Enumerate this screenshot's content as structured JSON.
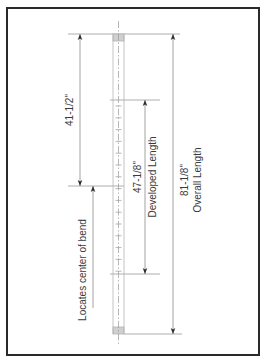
{
  "drawing": {
    "frame": {
      "x": 7,
      "y": 8,
      "w": 252,
      "h": 347,
      "stroke": "#2a2a2a"
    },
    "colors": {
      "line": "#9a9a9a",
      "dim": "#8c8c8c",
      "text": "#3a3a3a",
      "cap": "#cfcfcf",
      "pipe": "#b5b5b5"
    },
    "pipe": {
      "x1": 113,
      "x2": 124,
      "top": 34,
      "bottom": 334,
      "cap_len": 7,
      "center_top": 21,
      "center_bottom": 346
    },
    "ticks": {
      "from": 106,
      "to": 272,
      "step": 11.8
    },
    "dimensions": {
      "bend_offset": {
        "label": "41-1/2\"",
        "x": 80,
        "y1": 34,
        "y2": 186
      },
      "developed": {
        "value": "47-1/8\"",
        "label": "Developed Length",
        "x": 145,
        "y1": 100,
        "y2": 274
      },
      "overall": {
        "value": "81-1/8\"",
        "label": "Overall Length",
        "x": 173,
        "y1": 34,
        "y2": 334
      },
      "bend_note": {
        "label": "Locates center of bend",
        "x": 93,
        "y1": 186,
        "y2": 308
      }
    },
    "ext_lines": {
      "top": {
        "x1": 68,
        "x2": 180,
        "y": 34
      },
      "bend": {
        "x1": 68,
        "x2": 124,
        "y": 186
      },
      "dev_top": {
        "x1": 110,
        "x2": 160,
        "y": 100
      },
      "dev_bottom": {
        "x1": 110,
        "x2": 160,
        "y": 274
      },
      "bottom": {
        "x1": 124,
        "x2": 182,
        "y": 334
      }
    }
  }
}
